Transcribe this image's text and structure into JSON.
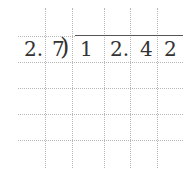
{
  "division": {
    "divisor": [
      "2.",
      "7"
    ],
    "bracket": ")",
    "dividend": [
      "1",
      "2.",
      "4",
      "2"
    ]
  }
}
